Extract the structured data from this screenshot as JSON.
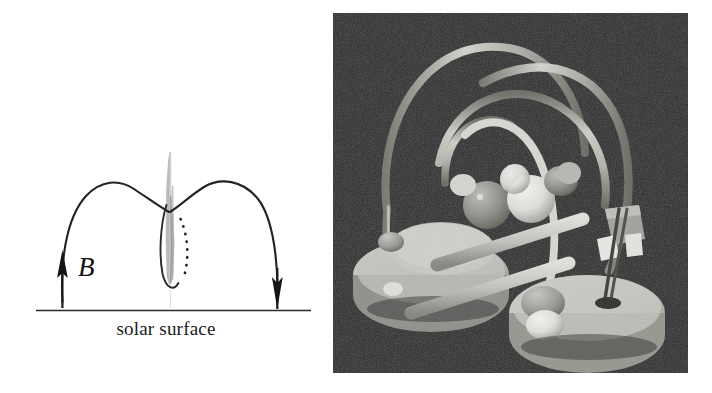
{
  "figure": {
    "kind": "two-panel scientific figure",
    "background_color": "#ffffff",
    "width": 712,
    "height": 393
  },
  "left_panel": {
    "name": "magnetic-arcade-schematic",
    "surface_label": "solar surface",
    "field_label": "B",
    "ink_color": "#1a1a1a",
    "plume_color": "#b9b9b9",
    "elements": {
      "left_arch": "field line arch rising from left footpoint to apex at centre",
      "right_arch": "field line arch rising from right footpoint to apex at centre",
      "left_arrow": "upward arrowhead at left footpoint indicating B direction",
      "right_arrow": "downward arrowhead at right footpoint indicating B direction",
      "current_sheet": "vertical grey plume / current sheet between the two arches",
      "dotted_curve": "dotted separatrix curve to the right of the current sheet",
      "baseline": "horizontal line representing the solar surface"
    },
    "geometry": {
      "baseline_y": 310,
      "baseline_x_start": 36,
      "baseline_x_end": 311,
      "left_footpoint_x": 62,
      "right_footpoint_x": 277,
      "apex_y": 182,
      "cusp_x": 170,
      "cusp_y": 212,
      "plume_top_y": 155,
      "plume_bottom_y": 285
    }
  },
  "right_panel": {
    "name": "laboratory-model-photograph",
    "background_color": "#2e2e2e",
    "frame": {
      "left": 333,
      "top": 13,
      "width": 355,
      "height": 360
    },
    "subject": "physical laboratory model of magnetic loops: two circular bases with vertical posts, connecting rods and flexible curved tubes forming arches, with spheres mounted near the apex",
    "parts": {
      "left_base": "circular disc base, light grey",
      "right_base": "circular disc base, light grey, lower right",
      "connecting_rods": "two light cylindrical rods linking the bases",
      "arch_tubes": "four flexible curved tubes forming overlapping arches",
      "spheres": "one mid-grey sphere and one bright white sphere near centre",
      "collars": "grey cylindrical collars where tubes meet the bases",
      "dark_rod": "dark slender rod on the right base"
    },
    "tones": {
      "background": "#2c2c2c",
      "base_light": "#c6c6c2",
      "base_mid": "#a9a9a4",
      "base_shadow": "#6f6f6c",
      "tube_light": "#d8d8d4",
      "tube_mid": "#b0b0ac",
      "tube_dark": "#76766f",
      "sphere_white": "#ececea",
      "sphere_grey": "#8f8f8a",
      "dark_rod": "#3a3a38"
    }
  }
}
